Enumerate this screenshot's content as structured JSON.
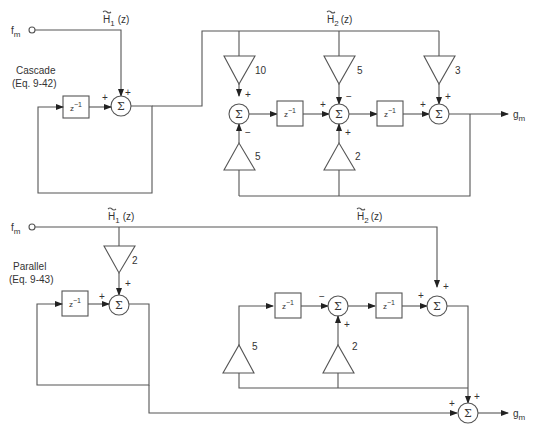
{
  "cascade": {
    "title": "Cascade",
    "equation": "(Eq. 9-42)",
    "input_label": "f",
    "input_sub": "m",
    "output_label": "g",
    "output_sub": "m",
    "h1_label": "H",
    "h1_sub": "1",
    "h1_arg": "(z)",
    "h2_label": "H",
    "h2_sub": "2",
    "h2_arg": "(z)",
    "delay_label": "z",
    "delay_exp": "−1",
    "sum_symbol": "Σ",
    "gains": {
      "g10": "10",
      "g5_top": "5",
      "g3": "3",
      "g5_bot": "5",
      "g2_bot": "2"
    },
    "signs": {
      "plus": "+",
      "minus": "−"
    }
  },
  "parallel": {
    "title": "Parallel",
    "equation": "(Eq. 9-43)",
    "input_label": "f",
    "input_sub": "m",
    "output_label": "g",
    "output_sub": "m",
    "h1_label": "H",
    "h1_sub": "1",
    "h1_arg": "(z)",
    "h2_label": "H",
    "h2_sub": "2",
    "h2_arg": "(z)",
    "delay_label": "z",
    "delay_exp": "−1",
    "sum_symbol": "Σ",
    "gains": {
      "g2_top": "2",
      "g5_bot": "5",
      "g2_bot": "2"
    },
    "signs": {
      "plus": "+",
      "minus": "−"
    }
  }
}
